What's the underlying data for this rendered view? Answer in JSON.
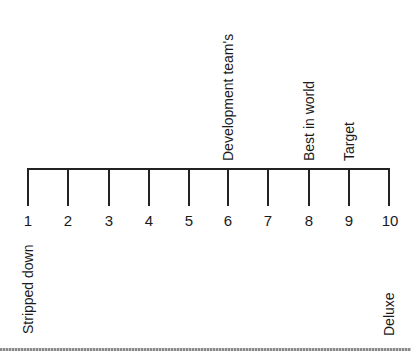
{
  "scale": {
    "min": 1,
    "max": 10,
    "ticks": [
      "1",
      "2",
      "3",
      "4",
      "5",
      "6",
      "7",
      "8",
      "9",
      "10"
    ],
    "left_end_label": "Stripped down",
    "right_end_label": "Deluxe"
  },
  "markers": [
    {
      "position": 6,
      "label": "Development team's"
    },
    {
      "position": 8,
      "label": "Best in world"
    },
    {
      "position": 9,
      "label": "Target"
    }
  ],
  "colors": {
    "line": "#222222",
    "text": "#1a1a1a",
    "background": "#ffffff"
  }
}
